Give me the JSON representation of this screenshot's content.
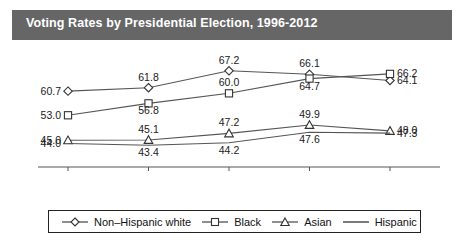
{
  "title": "Voting Rates by Presidential Election, 1996-2012",
  "legend": {
    "items": [
      {
        "label": "Non–Hispanic white",
        "marker": "diamond-icon"
      },
      {
        "label": "Black",
        "marker": "square-icon"
      },
      {
        "label": "Asian",
        "marker": "triangle-icon"
      },
      {
        "label": "Hispanic",
        "marker": "line-icon"
      }
    ]
  },
  "chart_data": {
    "type": "line",
    "title": "Voting Rates by Presidential Election, 1996-2012",
    "xlabel": "",
    "ylabel": "",
    "categories": [
      "1996",
      "2000",
      "2004",
      "2008",
      "2012"
    ],
    "x": [
      1996,
      2000,
      2004,
      2008,
      2012
    ],
    "ylim": [
      40,
      70
    ],
    "grid": false,
    "legend_position": "bottom",
    "series": [
      {
        "name": "Non–Hispanic white",
        "marker": "diamond",
        "values": [
          60.7,
          61.8,
          67.2,
          66.1,
          64.1
        ],
        "labels": [
          "60.7",
          "61.8",
          "67.2",
          "66.1",
          "64.1"
        ]
      },
      {
        "name": "Black",
        "marker": "square",
        "values": [
          53.0,
          56.8,
          60.0,
          64.7,
          66.2
        ],
        "labels": [
          "53.0",
          "56.8",
          "60.0",
          "64.7",
          "66.2"
        ]
      },
      {
        "name": "Asian",
        "marker": "triangle",
        "values": [
          45.0,
          45.1,
          47.2,
          49.9,
          48.0
        ],
        "labels": [
          "45.0",
          "45.1",
          "47.2",
          "49.9",
          "48.0"
        ]
      },
      {
        "name": "Hispanic",
        "marker": "none",
        "values": [
          44.0,
          43.4,
          44.2,
          47.6,
          47.3
        ],
        "labels": [
          "44.0",
          "43.4",
          "44.2",
          "47.6",
          "47.3"
        ]
      }
    ]
  },
  "colors": {
    "title_bar": "#666666",
    "title_text": "#ffffff",
    "line": "#555555",
    "marker_stroke": "#333333",
    "marker_fill": "#ffffff",
    "axis": "#555555",
    "background": "#ffffff"
  }
}
